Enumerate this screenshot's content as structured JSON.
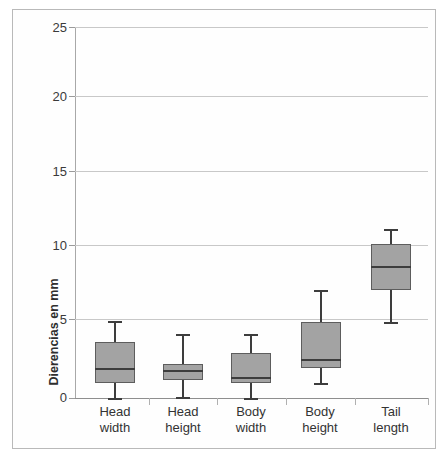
{
  "chart_data": {
    "type": "box",
    "title": "",
    "xlabel": "",
    "ylabel": "Dierencias en mm",
    "ylim": [
      0,
      25
    ],
    "yticks": [
      0,
      5,
      10,
      15,
      20,
      25
    ],
    "ytick_labels": [
      "0",
      "5",
      "10",
      "15",
      "20",
      "25"
    ],
    "grid": true,
    "legend": "none",
    "categories": [
      "Head width",
      "Head height",
      "Body width",
      "Body height",
      "Tail length"
    ],
    "category_lines": [
      [
        "Head",
        "width"
      ],
      [
        "Head",
        "height"
      ],
      [
        "Body",
        "width"
      ],
      [
        "Body",
        "height"
      ],
      [
        "Tail",
        "length"
      ]
    ],
    "boxes": [
      {
        "category": "Head width",
        "min": 0.0,
        "q1": 1.0,
        "median": 2.0,
        "q3": 3.8,
        "max": 5.2
      },
      {
        "category": "Head height",
        "min": 0.1,
        "q1": 1.2,
        "median": 1.9,
        "q3": 2.3,
        "max": 4.3
      },
      {
        "category": "Body width",
        "min": 0.0,
        "q1": 1.0,
        "median": 1.4,
        "q3": 3.0,
        "max": 4.3
      },
      {
        "category": "Body height",
        "min": 1.0,
        "q1": 2.0,
        "median": 2.6,
        "q3": 5.1,
        "max": 7.3
      },
      {
        "category": "Tail length",
        "min": 5.1,
        "q1": 7.3,
        "median": 8.9,
        "q3": 10.4,
        "max": 11.4
      }
    ],
    "colors": {
      "box_fill": "#a3a3a3",
      "box_border": "#5d5d5d",
      "median": "#3d3d3d",
      "whisker": "#3d3d3d",
      "gridline": "#c8c8c8",
      "axis": "#8e8e8e",
      "background": "#ffffff",
      "text": "#333333"
    }
  }
}
